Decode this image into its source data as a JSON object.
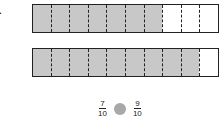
{
  "problem": {
    "number_label": "4.",
    "bars": [
      {
        "segments": 10,
        "shaded": 7
      },
      {
        "segments": 10,
        "shaded": 9
      }
    ],
    "comparison": {
      "left": {
        "numerator": "7",
        "denominator": "10"
      },
      "right": {
        "numerator": "9",
        "denominator": "10"
      },
      "blank": "comparison-circle"
    },
    "colors": {
      "shaded": "#c8c8c8",
      "unshaded": "#ffffff",
      "circle": "#a8a8a8",
      "border": "#222222"
    }
  }
}
